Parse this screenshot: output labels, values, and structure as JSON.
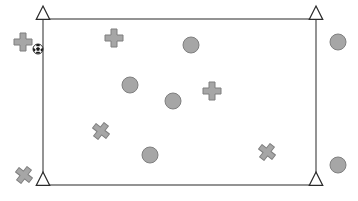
{
  "scene": {
    "title": "Field layout diagram",
    "canvas": {
      "width": 358,
      "height": 201,
      "background": "#ffffff"
    },
    "colors": {
      "boundary_stroke": "#666666",
      "marker_fill": "#a6a6a6",
      "marker_stroke": "#7f7f7f",
      "anchor_fill": "#ffffff",
      "anchor_stroke": "#2b2b2b",
      "ball_light": "#ffffff",
      "ball_dark": "#1a1a1a"
    },
    "boundary": {
      "label": "field-boundary-rectangle",
      "x": 43,
      "y": 19,
      "width": 273,
      "height": 166,
      "stroke_width": 1.4
    },
    "anchors": [
      {
        "label": "anchor-top-left",
        "x": 43,
        "y": 19,
        "size": 13
      },
      {
        "label": "anchor-top-right",
        "x": 316,
        "y": 19,
        "size": 13
      },
      {
        "label": "anchor-bottom-left",
        "x": 43,
        "y": 185,
        "size": 13
      },
      {
        "label": "anchor-bottom-right",
        "x": 316,
        "y": 185,
        "size": 13
      }
    ],
    "circles": [
      {
        "label": "circle-marker-1",
        "x": 191,
        "y": 45,
        "r": 8
      },
      {
        "label": "circle-marker-2",
        "x": 338,
        "y": 42,
        "r": 8
      },
      {
        "label": "circle-marker-3",
        "x": 130,
        "y": 85,
        "r": 8
      },
      {
        "label": "circle-marker-4",
        "x": 173,
        "y": 101,
        "r": 8
      },
      {
        "label": "circle-marker-5",
        "x": 150,
        "y": 155,
        "r": 8
      },
      {
        "label": "circle-marker-6",
        "x": 338,
        "y": 165,
        "r": 8
      }
    ],
    "crosses": [
      {
        "label": "cross-marker-1",
        "x": 114,
        "y": 38,
        "size": 18,
        "rotation": 0
      },
      {
        "label": "cross-marker-2",
        "x": 23,
        "y": 42,
        "size": 18,
        "rotation": 0
      },
      {
        "label": "cross-marker-3",
        "x": 212,
        "y": 91,
        "size": 18,
        "rotation": 0
      },
      {
        "label": "cross-marker-4",
        "x": 101,
        "y": 131,
        "size": 17,
        "rotation": 38
      },
      {
        "label": "cross-marker-5",
        "x": 267,
        "y": 152,
        "size": 17,
        "rotation": 38
      },
      {
        "label": "cross-marker-6",
        "x": 24,
        "y": 175,
        "size": 17,
        "rotation": 38
      }
    ],
    "ball": {
      "label": "soccer-ball-icon",
      "x": 38,
      "y": 49,
      "r": 5
    },
    "counts": {
      "circles": 6,
      "crosses": 6,
      "anchors": 4,
      "balls": 1
    }
  }
}
